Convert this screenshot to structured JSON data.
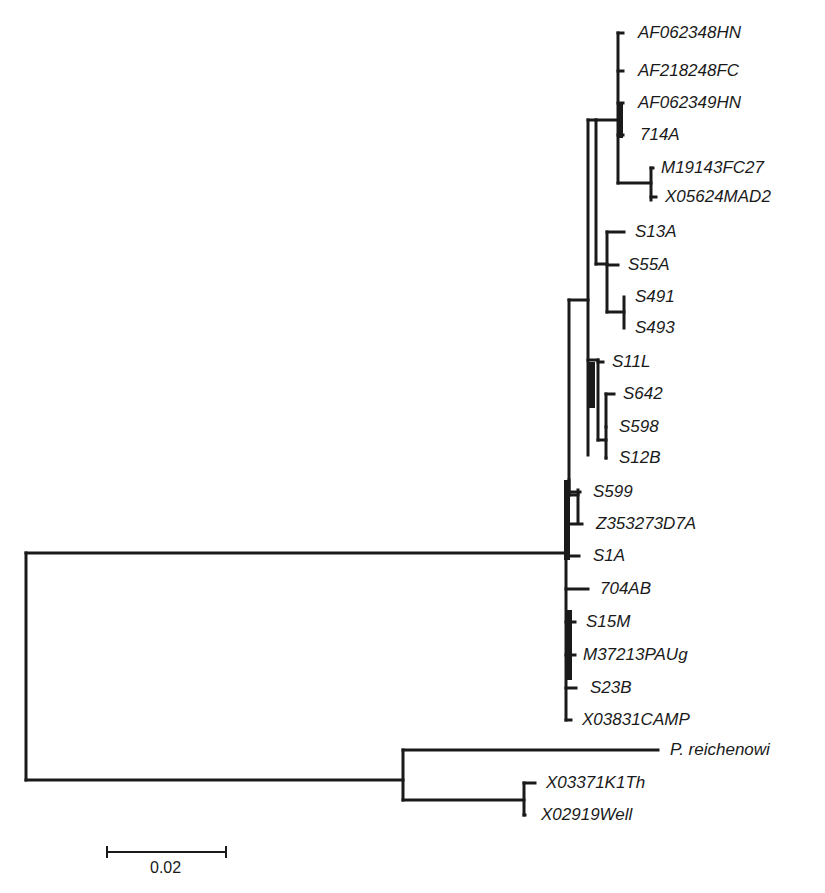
{
  "leaves": [
    {
      "label": "AF062348HN",
      "y": 33,
      "tip_x": 623,
      "label_x": 638
    },
    {
      "label": "AF218248FC",
      "y": 71,
      "tip_x": 623,
      "label_x": 638
    },
    {
      "label": "AF062349HN",
      "y": 103,
      "tip_x": 623,
      "label_x": 638
    },
    {
      "label": "714A",
      "y": 135,
      "tip_x": 623,
      "label_x": 640
    },
    {
      "label": "M19143FC27",
      "y": 168,
      "tip_x": 653,
      "label_x": 661
    },
    {
      "label": "X05624MAD2",
      "y": 197,
      "tip_x": 656,
      "label_x": 665
    },
    {
      "label": "S13A",
      "y": 232,
      "tip_x": 624,
      "label_x": 635
    },
    {
      "label": "S55A",
      "y": 265,
      "tip_x": 618,
      "label_x": 628
    },
    {
      "label": "S491",
      "y": 297,
      "tip_x": 624,
      "label_x": 635
    },
    {
      "label": "S493",
      "y": 328,
      "tip_x": 624,
      "label_x": 635
    },
    {
      "label": "S11L",
      "y": 362,
      "tip_x": 603,
      "label_x": 612
    },
    {
      "label": "S642",
      "y": 394,
      "tip_x": 614,
      "label_x": 623
    },
    {
      "label": "S598",
      "y": 427,
      "tip_x": 606,
      "label_x": 619
    },
    {
      "label": "S12B",
      "y": 458,
      "tip_x": 606,
      "label_x": 619
    },
    {
      "label": "S599",
      "y": 492,
      "tip_x": 580,
      "label_x": 593
    },
    {
      "label": "Z353273D7A",
      "y": 524,
      "tip_x": 582,
      "label_x": 596
    },
    {
      "label": "S1A",
      "y": 556,
      "tip_x": 579,
      "label_x": 593
    },
    {
      "label": "704AB",
      "y": 589,
      "tip_x": 588,
      "label_x": 600
    },
    {
      "label": "S15M",
      "y": 622,
      "tip_x": 575,
      "label_x": 586
    },
    {
      "label": "M37213PAUg",
      "y": 655,
      "tip_x": 575,
      "label_x": 583
    },
    {
      "label": "S23B",
      "y": 688,
      "tip_x": 576,
      "label_x": 590
    },
    {
      "label": "X03831CAMP",
      "y": 720,
      "tip_x": 571,
      "label_x": 582
    },
    {
      "label": "P. reichenowi",
      "y": 750,
      "tip_x": 658,
      "label_x": 670
    },
    {
      "label": "X03371K1Th",
      "y": 783,
      "tip_x": 535,
      "label_x": 546
    },
    {
      "label": "X02919Well",
      "y": 815,
      "tip_x": 525,
      "label_x": 541
    }
  ],
  "branches": [
    [
      26,
      553,
      26,
      780
    ],
    [
      26,
      553,
      566,
      553
    ],
    [
      26,
      780,
      403,
      780
    ],
    [
      403,
      750,
      403,
      800
    ],
    [
      403,
      750,
      658,
      750
    ],
    [
      403,
      800,
      524,
      800
    ],
    [
      524,
      783,
      524,
      815
    ],
    [
      524,
      783,
      535,
      783
    ],
    [
      524,
      815,
      525,
      815
    ],
    [
      566,
      495,
      566,
      720
    ],
    [
      566,
      492,
      580,
      492
    ],
    [
      566,
      524,
      582,
      524
    ],
    [
      566,
      556,
      579,
      556
    ],
    [
      566,
      589,
      588,
      589
    ],
    [
      566,
      622,
      575,
      622
    ],
    [
      566,
      655,
      575,
      655
    ],
    [
      566,
      688,
      576,
      688
    ],
    [
      566,
      720,
      571,
      720
    ],
    [
      566,
      495,
      578,
      495
    ],
    [
      578,
      490,
      578,
      522
    ],
    [
      569,
      480,
      569,
      495
    ],
    [
      569,
      300,
      569,
      495
    ],
    [
      569,
      300,
      588,
      300
    ],
    [
      588,
      120,
      588,
      455
    ],
    [
      588,
      360,
      598,
      360
    ],
    [
      598,
      360,
      598,
      440
    ],
    [
      598,
      362,
      603,
      362
    ],
    [
      598,
      440,
      606,
      440
    ],
    [
      606,
      394,
      606,
      458
    ],
    [
      606,
      394,
      614,
      394
    ],
    [
      606,
      427,
      606,
      427
    ],
    [
      606,
      458,
      606,
      458
    ],
    [
      588,
      120,
      596,
      120
    ],
    [
      596,
      120,
      596,
      264
    ],
    [
      596,
      264,
      607,
      264
    ],
    [
      607,
      232,
      607,
      312
    ],
    [
      607,
      232,
      624,
      232
    ],
    [
      607,
      265,
      618,
      265
    ],
    [
      607,
      312,
      624,
      312
    ],
    [
      624,
      297,
      624,
      328
    ],
    [
      596,
      120,
      618,
      120
    ],
    [
      618,
      33,
      618,
      183
    ],
    [
      618,
      33,
      623,
      33
    ],
    [
      618,
      71,
      623,
      71
    ],
    [
      618,
      103,
      623,
      103
    ],
    [
      618,
      135,
      623,
      135
    ],
    [
      618,
      183,
      651,
      183
    ],
    [
      651,
      168,
      651,
      200
    ],
    [
      651,
      168,
      653,
      168
    ],
    [
      651,
      197,
      656,
      197
    ]
  ],
  "thick_segments": [
    [
      620,
      102,
      620,
      138
    ],
    [
      592,
      362,
      592,
      408
    ],
    [
      567,
      480,
      567,
      560
    ],
    [
      569,
      610,
      569,
      680
    ]
  ],
  "scale_bar": {
    "label": "0.02",
    "x1": 107,
    "x2": 226,
    "y": 852
  }
}
